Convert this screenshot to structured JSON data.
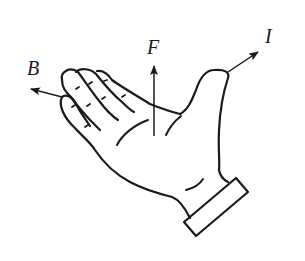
{
  "diagram": {
    "labels": {
      "magnetic_field": "B",
      "force": "F",
      "current": "I"
    },
    "colors": {
      "stroke": "#1a1a1a",
      "background": "#ffffff"
    }
  }
}
